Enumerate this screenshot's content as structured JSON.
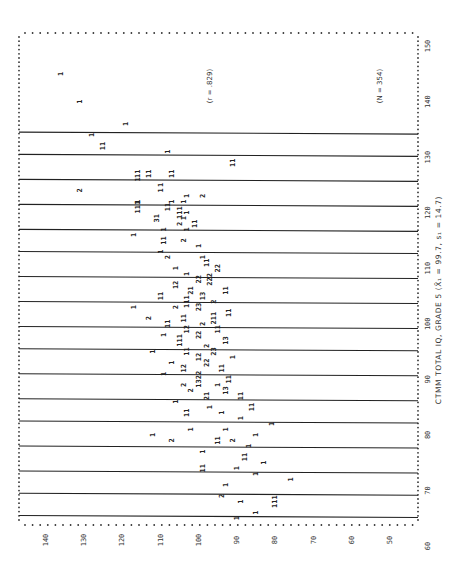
{
  "chart_data": {
    "type": "scatter",
    "subtype": "frequency-scatter (digits = count of cases at cell)",
    "orientation": "rotated 90 degrees clockwise",
    "title": "",
    "xlabel": "CTMM TOTAL IQ, GRADE 5 (X̄₁ = 99.7, s₁ = 14.7)",
    "ylabel": "",
    "xlim": [
      57,
      152
    ],
    "ylim": [
      45,
      142
    ],
    "x_ticks": [
      60,
      70,
      80,
      90,
      100,
      110,
      120,
      130,
      140,
      150
    ],
    "y_ticks": [
      140,
      130,
      120,
      110,
      100,
      90,
      80,
      70,
      60,
      50
    ],
    "grid_lines_x": [
      65.5,
      69.5,
      73.5,
      78,
      82.5,
      86.5,
      91,
      95.5,
      99.5,
      104,
      108.5,
      113,
      117,
      121.5,
      126,
      130.5,
      134.5
    ],
    "annotations": [
      "(r = .829)",
      "(N = 354)"
    ],
    "grid": false,
    "points": [
      {
        "x": 145,
        "y": 136,
        "n": 1
      },
      {
        "x": 140,
        "y": 131,
        "n": 1
      },
      {
        "x": 136,
        "y": 119,
        "n": 1
      },
      {
        "x": 134,
        "y": 128,
        "n": 1
      },
      {
        "x": 132,
        "y": 125,
        "n": 11
      },
      {
        "x": 131,
        "y": 108,
        "n": 1
      },
      {
        "x": 129,
        "y": 91,
        "n": 11
      },
      {
        "x": 127,
        "y": 116,
        "n": 11
      },
      {
        "x": 127,
        "y": 113,
        "n": 11
      },
      {
        "x": 127,
        "y": 107,
        "n": 11
      },
      {
        "x": 126,
        "y": 116,
        "n": 1
      },
      {
        "x": 125,
        "y": 110,
        "n": 1
      },
      {
        "x": 124,
        "y": 131,
        "n": 2
      },
      {
        "x": 124,
        "y": 110,
        "n": 1
      },
      {
        "x": 123,
        "y": 103,
        "n": 1
      },
      {
        "x": 123,
        "y": 99,
        "n": 2
      },
      {
        "x": 122,
        "y": 116,
        "n": 1
      },
      {
        "x": 122,
        "y": 107,
        "n": 1
      },
      {
        "x": 122,
        "y": 104,
        "n": 1
      },
      {
        "x": 121,
        "y": 116,
        "n": 111
      },
      {
        "x": 121,
        "y": 108,
        "n": 11
      },
      {
        "x": 120,
        "y": 103,
        "n": 1
      },
      {
        "x": 120,
        "y": 105,
        "n": 111
      },
      {
        "x": 119,
        "y": 111,
        "n": 31
      },
      {
        "x": 119,
        "y": 104,
        "n": 1
      },
      {
        "x": 118,
        "y": 105,
        "n": 2
      },
      {
        "x": 118,
        "y": 101,
        "n": 11
      },
      {
        "x": 117,
        "y": 109,
        "n": 1
      },
      {
        "x": 117,
        "y": 103,
        "n": 1
      },
      {
        "x": 116,
        "y": 117,
        "n": 1
      },
      {
        "x": 115,
        "y": 109,
        "n": 11
      },
      {
        "x": 115,
        "y": 104,
        "n": 2
      },
      {
        "x": 114,
        "y": 100,
        "n": 1
      },
      {
        "x": 113,
        "y": 110,
        "n": 1
      },
      {
        "x": 112,
        "y": 108,
        "n": 2
      },
      {
        "x": 112,
        "y": 99,
        "n": 1
      },
      {
        "x": 111,
        "y": 98,
        "n": 11
      },
      {
        "x": 110,
        "y": 106,
        "n": 1
      },
      {
        "x": 110,
        "y": 95,
        "n": 22
      },
      {
        "x": 109,
        "y": 103,
        "n": 1
      },
      {
        "x": 108,
        "y": 100,
        "n": 22
      },
      {
        "x": 108,
        "y": 97,
        "n": 222
      },
      {
        "x": 107,
        "y": 106,
        "n": 12
      },
      {
        "x": 106,
        "y": 102,
        "n": 21
      },
      {
        "x": 106,
        "y": 93,
        "n": 11
      },
      {
        "x": 105,
        "y": 110,
        "n": 11
      },
      {
        "x": 105,
        "y": 99,
        "n": 13
      },
      {
        "x": 104,
        "y": 103,
        "n": 111
      },
      {
        "x": 104,
        "y": 96,
        "n": 2
      },
      {
        "x": 103,
        "y": 117,
        "n": 1
      },
      {
        "x": 103,
        "y": 106,
        "n": 2
      },
      {
        "x": 103,
        "y": 100,
        "n": 23
      },
      {
        "x": 102,
        "y": 92,
        "n": 11
      },
      {
        "x": 101,
        "y": 113,
        "n": 2
      },
      {
        "x": 101,
        "y": 104,
        "n": 11
      },
      {
        "x": 101,
        "y": 96,
        "n": 211
      },
      {
        "x": 100,
        "y": 108,
        "n": 11
      },
      {
        "x": 100,
        "y": 99,
        "n": 2
      },
      {
        "x": 99,
        "y": 103,
        "n": 12
      },
      {
        "x": 99,
        "y": 95,
        "n": 11
      },
      {
        "x": 98,
        "y": 109,
        "n": 1
      },
      {
        "x": 98,
        "y": 100,
        "n": 22
      },
      {
        "x": 97,
        "y": 105,
        "n": 111
      },
      {
        "x": 97,
        "y": 93,
        "n": 13
      },
      {
        "x": 96,
        "y": 98,
        "n": 2
      },
      {
        "x": 95,
        "y": 112,
        "n": 1
      },
      {
        "x": 95,
        "y": 103,
        "n": 11
      },
      {
        "x": 95,
        "y": 96,
        "n": 23
      },
      {
        "x": 94,
        "y": 100,
        "n": 12
      },
      {
        "x": 94,
        "y": 91,
        "n": 1
      },
      {
        "x": 93,
        "y": 107,
        "n": 1
      },
      {
        "x": 93,
        "y": 98,
        "n": 22
      },
      {
        "x": 92,
        "y": 104,
        "n": 12
      },
      {
        "x": 92,
        "y": 94,
        "n": 11
      },
      {
        "x": 91,
        "y": 109,
        "n": 1
      },
      {
        "x": 90,
        "y": 100,
        "n": 1322
      },
      {
        "x": 90,
        "y": 92,
        "n": 11
      },
      {
        "x": 89,
        "y": 104,
        "n": 2
      },
      {
        "x": 89,
        "y": 95,
        "n": 1
      },
      {
        "x": 88,
        "y": 102,
        "n": 2
      },
      {
        "x": 88,
        "y": 93,
        "n": 13
      },
      {
        "x": 87,
        "y": 98,
        "n": 21
      },
      {
        "x": 87,
        "y": 89,
        "n": 11
      },
      {
        "x": 86,
        "y": 106,
        "n": 1
      },
      {
        "x": 85,
        "y": 97,
        "n": 1
      },
      {
        "x": 85,
        "y": 86,
        "n": 11
      },
      {
        "x": 84,
        "y": 103,
        "n": 11
      },
      {
        "x": 84,
        "y": 94,
        "n": 1
      },
      {
        "x": 83,
        "y": 89,
        "n": 1
      },
      {
        "x": 82,
        "y": 81,
        "n": 1
      },
      {
        "x": 81,
        "y": 102,
        "n": 1
      },
      {
        "x": 81,
        "y": 93,
        "n": 1
      },
      {
        "x": 80,
        "y": 85,
        "n": 1
      },
      {
        "x": 80,
        "y": 112,
        "n": 1
      },
      {
        "x": 79,
        "y": 107,
        "n": 2
      },
      {
        "x": 79,
        "y": 95,
        "n": 11
      },
      {
        "x": 79,
        "y": 91,
        "n": 2
      },
      {
        "x": 78,
        "y": 87,
        "n": 1
      },
      {
        "x": 77,
        "y": 99,
        "n": 1
      },
      {
        "x": 76,
        "y": 88,
        "n": 11
      },
      {
        "x": 75,
        "y": 83,
        "n": 1
      },
      {
        "x": 74,
        "y": 99,
        "n": 11
      },
      {
        "x": 74,
        "y": 90,
        "n": 1
      },
      {
        "x": 73,
        "y": 85,
        "n": 1
      },
      {
        "x": 72,
        "y": 76,
        "n": 1
      },
      {
        "x": 71,
        "y": 93,
        "n": 1
      },
      {
        "x": 69,
        "y": 94,
        "n": 2
      },
      {
        "x": 68,
        "y": 89,
        "n": 1
      },
      {
        "x": 68,
        "y": 80,
        "n": 111
      },
      {
        "x": 66,
        "y": 85,
        "n": 1
      },
      {
        "x": 65,
        "y": 90,
        "n": 1
      }
    ]
  }
}
